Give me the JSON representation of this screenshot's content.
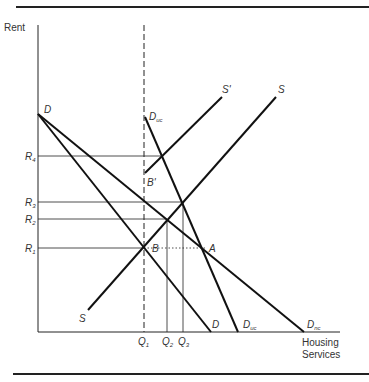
{
  "diagram": {
    "type": "supply-demand",
    "axes": {
      "y_label": "Rent",
      "x_label_line1": "Housing",
      "x_label_line2": "Services"
    },
    "rent_levels": [
      {
        "id": "R4",
        "base": "R",
        "sub": "4"
      },
      {
        "id": "R3",
        "base": "R",
        "sub": "3"
      },
      {
        "id": "R2",
        "base": "R",
        "sub": "2"
      },
      {
        "id": "R1",
        "base": "R",
        "sub": "1"
      }
    ],
    "quantities": [
      {
        "id": "Q1",
        "base": "Q",
        "sub": "1"
      },
      {
        "id": "Q2",
        "base": "Q",
        "sub": "2"
      },
      {
        "id": "Q3",
        "base": "Q",
        "sub": "3"
      }
    ],
    "curves": {
      "D_top": "D",
      "D_bottom": "D",
      "Duc_top": {
        "base": "D",
        "sub": "uc"
      },
      "Duc_bottom": {
        "base": "D",
        "sub": "uc"
      },
      "Dnc_bottom": {
        "base": "D",
        "sub": "nc"
      },
      "S_top": "S",
      "S_bottom": "S",
      "S_prime": "S'"
    },
    "points": {
      "A": "A",
      "B": "B",
      "B_prime": "B'"
    }
  }
}
